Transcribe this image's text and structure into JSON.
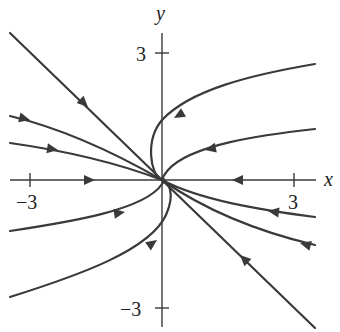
{
  "figure": {
    "type": "phase-portrait",
    "axes": {
      "x_label": "x",
      "y_label": "y",
      "x_ticks": [
        {
          "value": -3,
          "label": "−3"
        },
        {
          "value": 3,
          "label": "3"
        }
      ],
      "y_ticks": [
        {
          "value": 3,
          "label": "3"
        },
        {
          "value": -3,
          "label": "−3"
        }
      ]
    },
    "colors": {
      "stroke": "#3a3a3a",
      "background": "#ffffff"
    },
    "trajectories": [
      {
        "name": "straight-line-upper-left",
        "direction": "toward-origin"
      },
      {
        "name": "straight-line-lower-right",
        "direction": "toward-origin"
      },
      {
        "name": "x-axis-negative",
        "direction": "toward-origin"
      },
      {
        "name": "x-axis-positive",
        "direction": "toward-origin"
      },
      {
        "name": "left-upper-curve-1",
        "direction": "toward-origin"
      },
      {
        "name": "left-upper-curve-2",
        "direction": "toward-origin"
      },
      {
        "name": "left-lower-curve-1",
        "direction": "toward-origin"
      },
      {
        "name": "left-lower-curve-2",
        "direction": "toward-origin"
      },
      {
        "name": "right-upper-curve-1",
        "direction": "toward-origin"
      },
      {
        "name": "right-upper-curve-2",
        "direction": "toward-origin"
      },
      {
        "name": "right-lower-curve-1",
        "direction": "toward-origin"
      },
      {
        "name": "right-lower-curve-2",
        "direction": "toward-origin"
      }
    ]
  }
}
